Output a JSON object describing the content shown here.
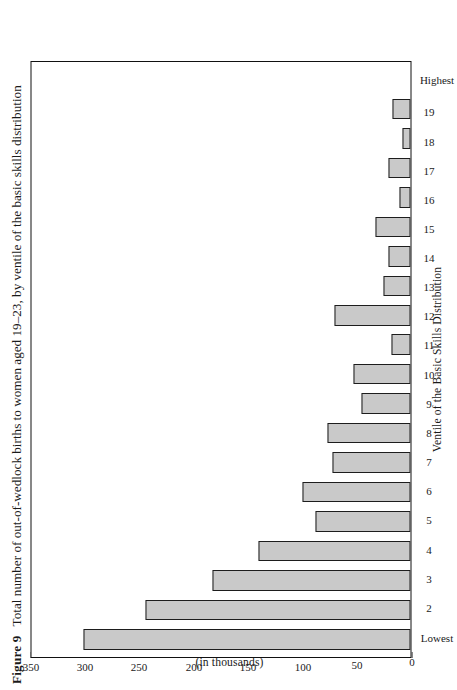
{
  "figure": {
    "number_label": "Figure 9",
    "caption": "Total number of out-of-wedlock births to women aged 19–23, by ventile of the basic skills distribution"
  },
  "axes": {
    "value_axis_title_line1": "Number of Children Born Out Of Wedlock",
    "value_axis_title_line2": "(in thousands)",
    "category_axis_title": "Ventile of the Basic Skills Distribution",
    "value_ticks": [
      "0",
      "50",
      "100",
      "150",
      "200",
      "250",
      "300",
      "350"
    ]
  },
  "style": {
    "bar_fill": "#c9c9c9",
    "bar_border": "#1d1d1d",
    "frame": "#111111",
    "background": "#ffffff"
  },
  "chart_data": {
    "type": "bar",
    "title": "Total number of out-of-wedlock births to women aged 19–23, by ventile of the basic skills distribution",
    "xlabel": "Ventile of the Basic Skills Distribution",
    "ylabel": "Number of Children Born Out Of Wedlock (in thousands)",
    "ylim": [
      0,
      350
    ],
    "yticks": [
      0,
      50,
      100,
      150,
      200,
      250,
      300,
      350
    ],
    "grid": false,
    "legend": "none",
    "orientation": "vertical-bars-rendered-rotated",
    "categories": [
      "Lowest",
      "2",
      "3",
      "4",
      "5",
      "6",
      "7",
      "8",
      "9",
      "10",
      "11",
      "12",
      "13",
      "14",
      "15",
      "16",
      "17",
      "18",
      "19",
      "Highest"
    ],
    "values": [
      302,
      245,
      183,
      140,
      88,
      100,
      72,
      77,
      45,
      53,
      18,
      70,
      25,
      20,
      32,
      10,
      20,
      7,
      17,
      0
    ]
  }
}
